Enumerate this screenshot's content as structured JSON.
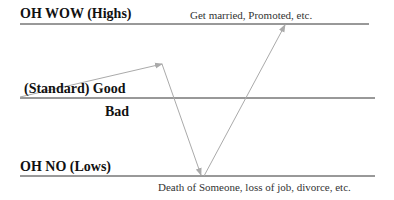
{
  "high": {
    "label": "OH WOW (Highs)",
    "note": "Get married, Promoted, etc."
  },
  "standard": {
    "label": "(Standard)  Good",
    "bad_label": "Bad"
  },
  "low": {
    "label": "OH NO  (Lows)",
    "note": "Death of Someone, loss of job, divorce, etc."
  },
  "colors": {
    "line": "#333333",
    "arrow": "#aaaaaa"
  }
}
